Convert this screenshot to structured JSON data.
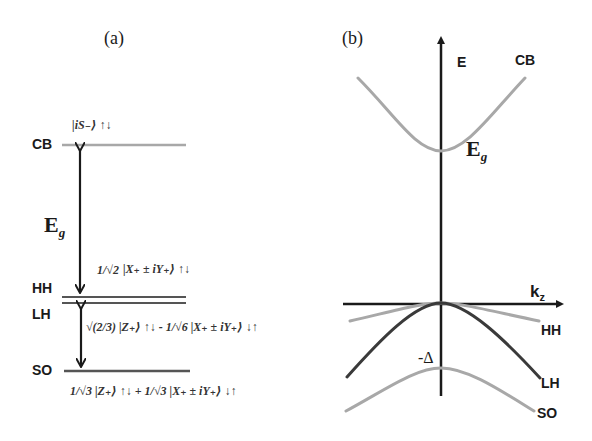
{
  "panel_a": {
    "label": "(a)",
    "levels": {
      "cb": {
        "label": "CB",
        "state": "|iS₋⟩ ↑↓"
      },
      "hh": {
        "label": "HH",
        "coef": "1/√2",
        "state": "|X₊ ± iY₊⟩ ↑↓"
      },
      "lh": {
        "label": "LH",
        "coef1": "√(2/3)",
        "state1": "|Z₊⟩ ↑↓",
        "sep": "-",
        "coef2": "1/√6",
        "state2": "|X₊ ± iY₊⟩ ↓↑"
      },
      "so": {
        "label": "SO",
        "coef1": "1/√3",
        "state1": "|Z₊⟩ ↑↓",
        "sep": "+",
        "coef2": "1/√3",
        "state2": "|X₊ ± iY₊⟩ ↓↑"
      }
    },
    "gap_label": "E",
    "gap_sub": "g"
  },
  "panel_b": {
    "label": "(b)",
    "y_axis_label": "E",
    "x_axis_label": "k",
    "x_axis_sub": "z",
    "bands": {
      "cb": "CB",
      "hh": "HH",
      "lh": "LH",
      "so": "SO"
    },
    "gap_label": "E",
    "gap_sub": "g",
    "split_label": "-Δ"
  },
  "colors": {
    "gray_band": "#a8a8a8",
    "dark_band": "#3a3a3a",
    "axis": "#1a1a1a"
  }
}
